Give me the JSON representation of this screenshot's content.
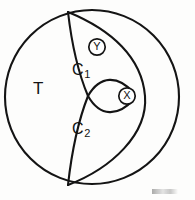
{
  "figure": {
    "type": "topological-diagram",
    "outer_region_label": "T",
    "regions": [
      {
        "id": "c1",
        "label": "C",
        "subscript": "1"
      },
      {
        "id": "c2",
        "label": "C",
        "subscript": "2"
      }
    ],
    "markers": [
      {
        "id": "y",
        "label": "Y",
        "position": "upper-interior"
      },
      {
        "id": "x",
        "label": "X",
        "position": "right-cusp"
      }
    ],
    "caption": ""
  },
  "geometry": {
    "outer_circle": {
      "cx": 92,
      "cy": 97,
      "r": 87
    },
    "marker_y": {
      "cx": 97,
      "cy": 47,
      "r": 8.2
    },
    "marker_x": {
      "cx": 127,
      "cy": 96,
      "r": 8.2
    },
    "crossing_point": {
      "x": 88,
      "y": 96
    },
    "top_junction": {
      "x": 68,
      "y": 12
    },
    "bottom_junction": {
      "x": 68,
      "y": 185
    }
  },
  "colors": {
    "ink": "#141414",
    "paper": "#fdfdfc"
  }
}
